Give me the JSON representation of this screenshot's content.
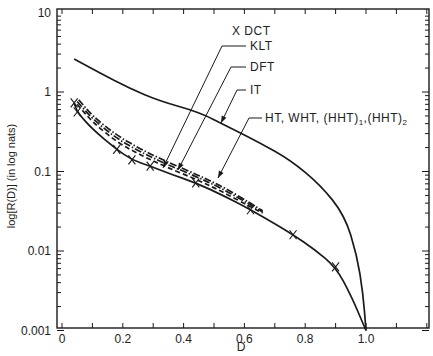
{
  "chart_data": {
    "type": "line",
    "title": "",
    "xlabel": "D",
    "ylabel": "log[R(D)] (in log nats)",
    "xlim": [
      0,
      1.2
    ],
    "ylim": [
      0.001,
      10
    ],
    "yscale": "log",
    "grid": false,
    "x_ticks": [
      0,
      0.1,
      0.2,
      0.3,
      0.4,
      0.5,
      0.6,
      0.7,
      0.8,
      0.9,
      1.0,
      1.1,
      1.2
    ],
    "x_tick_labels": [
      {
        "value": 0,
        "label": "0"
      },
      {
        "value": 0.2,
        "label": "0.2"
      },
      {
        "value": 0.4,
        "label": "0.4"
      },
      {
        "value": 0.6,
        "label": "0.6"
      },
      {
        "value": 0.8,
        "label": "0.8"
      },
      {
        "value": 1.0,
        "label": "1.0"
      }
    ],
    "y_tick_labels": [
      {
        "value": 10,
        "label": "10"
      },
      {
        "value": 1,
        "label": "1"
      },
      {
        "value": 0.1,
        "label": "0.1"
      },
      {
        "value": 0.01,
        "label": "0.01"
      },
      {
        "value": 0.001,
        "label": "0.001"
      }
    ],
    "series": [
      {
        "name": "Upper bound (untransformed)",
        "style": "solid",
        "x": [
          0.04,
          0.125,
          0.22,
          0.32,
          0.45,
          0.55,
          0.65,
          0.75,
          0.85,
          0.93,
          0.97,
          0.99,
          1.0
        ],
        "y": [
          2.6,
          1.73,
          1.12,
          0.77,
          0.56,
          0.36,
          0.23,
          0.14,
          0.068,
          0.028,
          0.0089,
          0.003,
          0.001
        ]
      },
      {
        "name": "KLT",
        "style": "solid",
        "x": [
          0.04,
          0.05,
          0.1,
          0.18,
          0.23,
          0.29,
          0.36,
          0.44,
          0.53,
          0.62,
          0.7,
          0.76,
          0.83,
          0.9,
          0.95,
          1.0
        ],
        "y": [
          0.73,
          0.56,
          0.34,
          0.19,
          0.14,
          0.117,
          0.092,
          0.072,
          0.05,
          0.033,
          0.022,
          0.016,
          0.0105,
          0.0063,
          0.0028,
          0.001
        ]
      },
      {
        "name": "DCT",
        "style": "markers",
        "marker": "x",
        "x": [
          0.04,
          0.05,
          0.18,
          0.23,
          0.29,
          0.44,
          0.62,
          0.76,
          0.9
        ],
        "y": [
          0.73,
          0.56,
          0.19,
          0.14,
          0.117,
          0.072,
          0.033,
          0.016,
          0.0063
        ]
      },
      {
        "name": "DFT",
        "style": "dashed",
        "x": [
          0.05,
          0.1,
          0.18,
          0.26,
          0.34,
          0.44,
          0.53,
          0.62,
          0.66
        ],
        "y": [
          0.7,
          0.42,
          0.235,
          0.16,
          0.115,
          0.08,
          0.055,
          0.036,
          0.03
        ]
      },
      {
        "name": "IT",
        "style": "dashdot",
        "x": [
          0.05,
          0.1,
          0.18,
          0.26,
          0.34,
          0.44,
          0.53,
          0.62,
          0.66
        ],
        "y": [
          0.76,
          0.46,
          0.26,
          0.175,
          0.125,
          0.087,
          0.06,
          0.038,
          0.031
        ]
      },
      {
        "name": "HT, WHT, (HHT)1, (HHT)2",
        "style": "dashdot",
        "x": [
          0.055,
          0.1,
          0.18,
          0.26,
          0.34,
          0.44,
          0.53,
          0.62,
          0.66
        ],
        "y": [
          0.8,
          0.5,
          0.285,
          0.19,
          0.135,
          0.093,
          0.064,
          0.04,
          0.032
        ]
      }
    ],
    "annotations": [
      {
        "text": "X DCT",
        "label_x": 0.51,
        "label_y": 3.4
      },
      {
        "text": "KLT",
        "label_x": 0.53,
        "label_y": 2.2,
        "arrow_to": [
          0.33,
          0.1
        ]
      },
      {
        "text": "DFT",
        "label_x": 0.53,
        "label_y": 1.18,
        "arrow_to": [
          0.37,
          0.095
        ]
      },
      {
        "text": "IT",
        "label_x": 0.52,
        "label_y": 0.62,
        "arrow_to": [
          0.52,
          0.4
        ]
      },
      {
        "text": "HT, WHT, (HHT)1,(HHT)2",
        "label_x": 0.6,
        "label_y": 0.28,
        "arrow_to": [
          0.51,
          0.08
        ]
      }
    ]
  },
  "labels": {
    "x_axis": "D",
    "y_axis": "log[R(D)] (in log nats)",
    "annotation_dct": "X DCT",
    "annotation_klt": "KLT",
    "annotation_dft": "DFT",
    "annotation_it": "IT",
    "annotation_ht": "HT, WHT, (HHT)",
    "annotation_ht_sub1": "1",
    "annotation_ht_mid": ",(HHT)",
    "annotation_ht_sub2": "2"
  }
}
